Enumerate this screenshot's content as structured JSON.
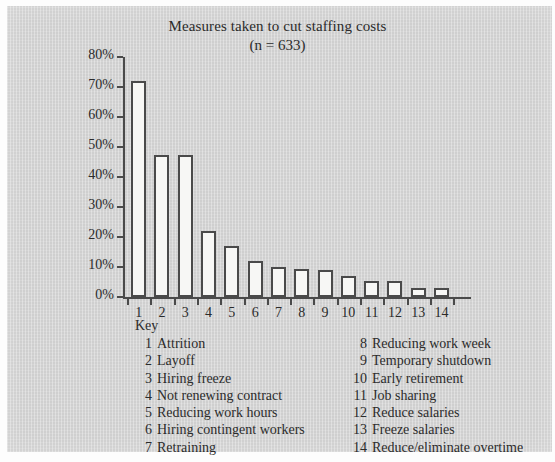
{
  "chart_data": {
    "type": "bar",
    "title": "Measures taken to cut staffing costs",
    "subtitle": "(n = 633)",
    "xlabel": "",
    "ylabel": "",
    "ylim": [
      0,
      80
    ],
    "grid": false,
    "legend_position": "below-plot",
    "categories": [
      "1",
      "2",
      "3",
      "4",
      "5",
      "6",
      "7",
      "8",
      "9",
      "10",
      "11",
      "12",
      "13",
      "14"
    ],
    "ytick_labels": [
      "0%",
      "10%",
      "20%",
      "30%",
      "40%",
      "50%",
      "60%",
      "70%",
      "80%"
    ],
    "ytick_values": [
      0,
      10,
      20,
      30,
      40,
      50,
      60,
      70,
      80
    ],
    "values": [
      72,
      47.5,
      47.5,
      22,
      17,
      12,
      10,
      9.5,
      9,
      7,
      5.5,
      5.5,
      3,
      3
    ],
    "series": [
      {
        "name": "Percent of respondents",
        "values": [
          72,
          47.5,
          47.5,
          22,
          17,
          12,
          10,
          9.5,
          9,
          7,
          5.5,
          5.5,
          3,
          3
        ]
      }
    ],
    "bar_color": "#f7f7f5",
    "bar_outline_color": "#4a4a4a",
    "axis_color": "#4a4a4a",
    "background_color": "#cfcfcf"
  },
  "key": {
    "heading": "Key",
    "left_column": [
      {
        "num": "1",
        "label": "Attrition"
      },
      {
        "num": "2",
        "label": "Layoff"
      },
      {
        "num": "3",
        "label": "Hiring freeze"
      },
      {
        "num": "4",
        "label": "Not renewing contract"
      },
      {
        "num": "5",
        "label": "Reducing work hours"
      },
      {
        "num": "6",
        "label": "Hiring contingent workers"
      },
      {
        "num": "7",
        "label": "Retraining"
      }
    ],
    "right_column": [
      {
        "num": "8",
        "label": "Reducing work week"
      },
      {
        "num": "9",
        "label": "Temporary shutdown"
      },
      {
        "num": "10",
        "label": "Early retirement"
      },
      {
        "num": "11",
        "label": "Job sharing"
      },
      {
        "num": "12",
        "label": "Reduce salaries"
      },
      {
        "num": "13",
        "label": "Freeze salaries"
      },
      {
        "num": "14",
        "label": "Reduce/eliminate overtime"
      }
    ]
  }
}
